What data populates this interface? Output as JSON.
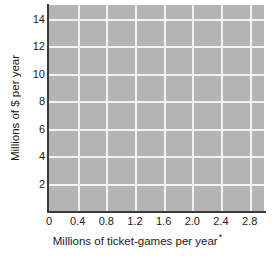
{
  "chart_data": {
    "type": "scatter",
    "title": "",
    "subtitle": "",
    "xlabel": "Millions of ticket-games per year",
    "xlabel_footnote": "*",
    "ylabel": "Millions of $ per year",
    "xlim": [
      0,
      3.0
    ],
    "ylim": [
      0,
      15
    ],
    "x_ticks": [
      0,
      0.4,
      0.8,
      1.2,
      1.6,
      2.0,
      2.4,
      2.8
    ],
    "x_tick_labels": [
      "0",
      "0.4",
      "0.8",
      "1.2",
      "1.6",
      "2.0",
      "2.4",
      "2.8"
    ],
    "y_ticks": [
      2,
      4,
      6,
      8,
      10,
      12,
      14
    ],
    "y_tick_labels": [
      "2",
      "4",
      "6",
      "8",
      "10",
      "12",
      "14"
    ],
    "grid": true,
    "grid_color": "#f2f2f2",
    "plot_background": "#b4b4b4",
    "axis_color": "#3a3a3a",
    "series": [],
    "values": [],
    "categories": [],
    "annotations": [],
    "legend": null,
    "note": "Blank grid; no data series plotted"
  },
  "axes": {
    "x_title": "Millions of ticket-games per year",
    "x_footnote_mark": "*",
    "y_title": "Millions of $ per year",
    "x_tick_labels": [
      "0",
      "0.4",
      "0.8",
      "1.2",
      "1.6",
      "2.0",
      "2.4",
      "2.8"
    ],
    "y_tick_labels": [
      "2",
      "4",
      "6",
      "8",
      "10",
      "12",
      "14"
    ]
  }
}
